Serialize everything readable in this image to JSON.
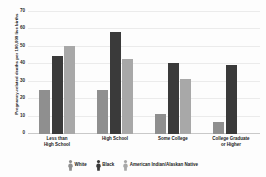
{
  "chart_data": {
    "type": "bar",
    "title": "",
    "xlabel": "",
    "ylabel": "Pregnancy-related deaths per 100,000 live births",
    "ylim": [
      0,
      70
    ],
    "yticks": [
      0,
      10,
      20,
      30,
      40,
      50,
      60,
      70
    ],
    "ytick_labels": [
      "0",
      "10",
      "20",
      "30",
      "40",
      "50",
      "60",
      "70"
    ],
    "grid": true,
    "legend_position": "bottom",
    "categories": [
      "Less than\nHigh School",
      "High School",
      "Some College",
      "College Graduate\nor Higher"
    ],
    "series": [
      {
        "name": "White",
        "color": "#8f8f8f",
        "icon": "person-icon",
        "values": [
          25,
          25,
          11.5,
          7
        ]
      },
      {
        "name": "Black",
        "color": "#3a3a3a",
        "icon": "person-icon",
        "values": [
          45,
          58.5,
          40.5,
          39.5
        ]
      },
      {
        "name": "American Indian/Alaskan Native",
        "color": "#a8a8a8",
        "icon": "person-icon",
        "values": [
          50.5,
          43,
          31.5,
          null
        ]
      }
    ]
  },
  "colors": {
    "background": "#fdfdfd",
    "gridline": "#ebebeb",
    "axis": "#c9c9c9",
    "text": "#1a1a1a",
    "series_white": "#8f8f8f",
    "series_black": "#3a3a3a",
    "series_aian": "#a8a8a8"
  }
}
